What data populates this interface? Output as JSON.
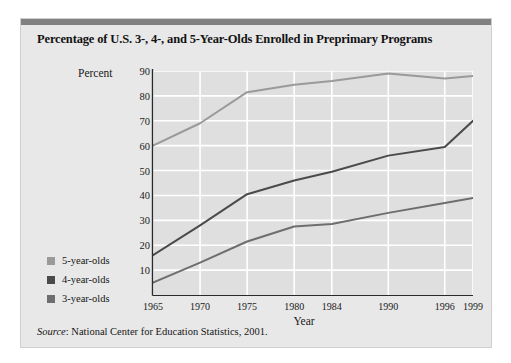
{
  "card": {
    "title": "Percentage of U.S. 3-, 4-, and 5-Year-Olds Enrolled in Preprimary Programs",
    "source_label": "Source",
    "source_text": ": National Center for Education Statistics, 2001.",
    "topbar_color": "#808080",
    "background_color": "#e8e8e8"
  },
  "chart_data": {
    "type": "line",
    "title": "Percentage of U.S. 3-, 4-, and 5-Year-Olds Enrolled in Preprimary Programs",
    "xlabel": "Year",
    "ylabel": "Percent",
    "categories": [
      "1965",
      "1970",
      "1975",
      "1980",
      "1984",
      "1990",
      "1996",
      "1999"
    ],
    "x": [
      1965,
      1970,
      1975,
      1980,
      1984,
      1990,
      1996,
      1999
    ],
    "xlim": [
      1965,
      1999
    ],
    "ylim": [
      0,
      90
    ],
    "yticks": [
      10,
      20,
      30,
      40,
      50,
      60,
      70,
      80,
      90
    ],
    "xticks": [
      "1965",
      "1970",
      "1975",
      "1980",
      "1984",
      "1990",
      "1996",
      "1999"
    ],
    "grid": true,
    "grid_color": "#ffffff",
    "plot_background": "#dfdfdf",
    "legend_position": "left-outside",
    "series": [
      {
        "name": "5-year-olds",
        "color": "#9a9a9a",
        "values": [
          60,
          69,
          81.5,
          84.5,
          86,
          89,
          87,
          88
        ]
      },
      {
        "name": "4-year-olds",
        "color": "#4a4a4a",
        "values": [
          16,
          28,
          40.5,
          46,
          49.5,
          56,
          59.5,
          70
        ]
      },
      {
        "name": "3-year-olds",
        "color": "#6e6e6e",
        "values": [
          5,
          13,
          21.5,
          27.5,
          28.5,
          33,
          37,
          39
        ]
      }
    ]
  }
}
